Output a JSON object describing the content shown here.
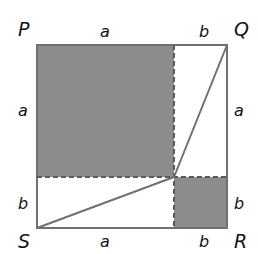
{
  "diagram": {
    "vertices": {
      "P": "P",
      "Q": "Q",
      "R": "R",
      "S": "S"
    },
    "top_labels": [
      "a",
      "b"
    ],
    "bottom_labels": [
      "a",
      "b"
    ],
    "left_labels": [
      "a",
      "b"
    ],
    "right_labels": [
      "a",
      "b"
    ],
    "colors": {
      "shade": "#8c8c8c",
      "stroke": "#707070",
      "dash": "#5a5a5a",
      "background": "#ffffff"
    }
  }
}
